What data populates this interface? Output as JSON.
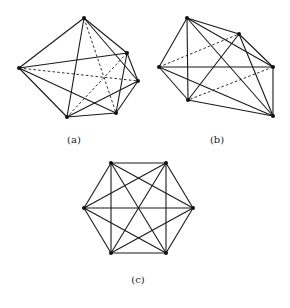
{
  "figures": [
    {
      "id": "a",
      "caption": "(a)",
      "caption_pos": [
        74,
        134
      ],
      "vertices": {
        "T": [
          84,
          18
        ],
        "UR": [
          127,
          53
        ],
        "R": [
          138,
          81
        ],
        "BR": [
          116,
          113
        ],
        "BL": [
          67,
          117
        ],
        "L": [
          19,
          68
        ]
      },
      "edges": [
        [
          "T",
          "L",
          "solid"
        ],
        [
          "T",
          "UR",
          "solid"
        ],
        [
          "T",
          "R",
          "solid"
        ],
        [
          "T",
          "BL",
          "solid"
        ],
        [
          "T",
          "BR",
          "dashed"
        ],
        [
          "L",
          "UR",
          "solid"
        ],
        [
          "L",
          "R",
          "dashed"
        ],
        [
          "L",
          "BL",
          "solid"
        ],
        [
          "L",
          "BR",
          "solid"
        ],
        [
          "UR",
          "R",
          "solid"
        ],
        [
          "UR",
          "BR",
          "solid"
        ],
        [
          "UR",
          "BL",
          "dashed"
        ],
        [
          "R",
          "BR",
          "solid"
        ],
        [
          "R",
          "BL",
          "solid"
        ],
        [
          "BL",
          "BR",
          "solid"
        ]
      ]
    },
    {
      "id": "b",
      "caption": "(b)",
      "caption_pos": [
        217,
        134
      ],
      "vertices": {
        "T": [
          187,
          18
        ],
        "UR": [
          239,
          34
        ],
        "L": [
          159,
          67
        ],
        "R": [
          273,
          67
        ],
        "BL": [
          188,
          100
        ],
        "BR": [
          273,
          116
        ]
      },
      "edges": [
        [
          "T",
          "L",
          "solid"
        ],
        [
          "T",
          "UR",
          "solid"
        ],
        [
          "T",
          "R",
          "solid"
        ],
        [
          "T",
          "BL",
          "solid"
        ],
        [
          "T",
          "BR",
          "solid"
        ],
        [
          "L",
          "UR",
          "dashed"
        ],
        [
          "L",
          "R",
          "solid"
        ],
        [
          "L",
          "BL",
          "solid"
        ],
        [
          "L",
          "BR",
          "solid"
        ],
        [
          "UR",
          "R",
          "solid"
        ],
        [
          "UR",
          "BR",
          "solid"
        ],
        [
          "UR",
          "BL",
          "solid"
        ],
        [
          "R",
          "BL",
          "dashed"
        ],
        [
          "R",
          "BR",
          "solid"
        ],
        [
          "BL",
          "BR",
          "solid"
        ]
      ]
    },
    {
      "id": "c",
      "caption": "(c)",
      "caption_pos": [
        138,
        274
      ],
      "vertices": {
        "TL": [
          111,
          163
        ],
        "TR": [
          166,
          163
        ],
        "L": [
          84,
          208
        ],
        "R": [
          193,
          208
        ],
        "BL": [
          111,
          253
        ],
        "BR": [
          166,
          253
        ]
      },
      "edges": [
        [
          "TL",
          "TR",
          "solid"
        ],
        [
          "TL",
          "L",
          "solid"
        ],
        [
          "TL",
          "R",
          "solid"
        ],
        [
          "TL",
          "BL",
          "solid"
        ],
        [
          "TL",
          "BR",
          "solid"
        ],
        [
          "TR",
          "L",
          "solid"
        ],
        [
          "TR",
          "R",
          "solid"
        ],
        [
          "TR",
          "BL",
          "solid"
        ],
        [
          "TR",
          "BR",
          "solid"
        ],
        [
          "L",
          "R",
          "solid"
        ],
        [
          "L",
          "BL",
          "solid"
        ],
        [
          "L",
          "BR",
          "solid"
        ],
        [
          "R",
          "BL",
          "solid"
        ],
        [
          "R",
          "BR",
          "solid"
        ],
        [
          "BL",
          "BR",
          "solid"
        ]
      ]
    }
  ]
}
